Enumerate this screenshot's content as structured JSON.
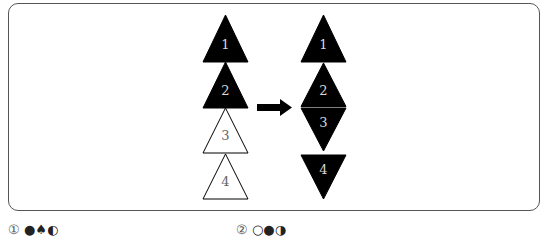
{
  "figure": {
    "left_column": {
      "triangles": [
        {
          "label": "1",
          "fill": "black",
          "orientation": "up"
        },
        {
          "label": "2",
          "fill": "black",
          "orientation": "up"
        },
        {
          "label": "3",
          "fill": "white",
          "orientation": "up"
        },
        {
          "label": "4",
          "fill": "white",
          "orientation": "up"
        }
      ]
    },
    "arrow": {
      "direction": "right",
      "icon": "arrow-right-icon"
    },
    "right_column": {
      "triangles": [
        {
          "label": "1",
          "fill": "black",
          "orientation": "up"
        },
        {
          "label": "2",
          "fill": "black",
          "orientation": "up"
        },
        {
          "label": "3",
          "fill": "black",
          "orientation": "down"
        },
        {
          "label": "4",
          "fill": "black",
          "orientation": "down"
        }
      ]
    }
  },
  "options": [
    {
      "number": "①",
      "symbols": "●♠◐"
    },
    {
      "number": "②",
      "symbols": "○●◑"
    }
  ],
  "colors": {
    "frame": "#555555",
    "fill_black": "#000000",
    "label_on_black": "#d8d8d8",
    "label_on_white": "#666666"
  }
}
